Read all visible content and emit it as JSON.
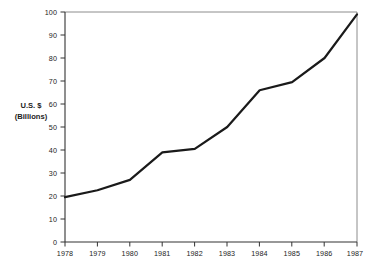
{
  "chart_data": {
    "type": "line",
    "title": "",
    "subtitle": "",
    "xlabel": "",
    "ylabel": "U.S. $\n(Billions)",
    "ylabel_line1": "U.S. $",
    "ylabel_line2": "(Billions)",
    "categories": [
      "1978",
      "1979",
      "1980",
      "1981",
      "1982",
      "1983",
      "1984",
      "1985",
      "1986",
      "1987"
    ],
    "x": [
      1978,
      1979,
      1980,
      1981,
      1982,
      1983,
      1984,
      1985,
      1986,
      1987
    ],
    "values": [
      19.5,
      22.5,
      27,
      39,
      40.5,
      50,
      66,
      69.5,
      80,
      99
    ],
    "series": [
      {
        "name": "U.S. $ (Billions)",
        "values": [
          19.5,
          22.5,
          27,
          39,
          40.5,
          50,
          66,
          69.5,
          80,
          99
        ]
      }
    ],
    "xlim": [
      1978,
      1987
    ],
    "ylim": [
      0,
      100
    ],
    "yticks": [
      0,
      10,
      20,
      30,
      40,
      50,
      60,
      70,
      80,
      90,
      100
    ],
    "ytick_labels": [
      "0",
      "10",
      "20",
      "30",
      "40",
      "50",
      "60",
      "70",
      "80",
      "90",
      "100"
    ],
    "xticks": [
      1978,
      1979,
      1980,
      1981,
      1982,
      1983,
      1984,
      1985,
      1986,
      1987
    ],
    "xtick_labels": [
      "1978",
      "1979",
      "1980",
      "1981",
      "1982",
      "1983",
      "1984",
      "1985",
      "1986",
      "1987"
    ],
    "grid": false,
    "legend": false,
    "legend_position": "none",
    "line_color": "#1a1a1a",
    "line_width": 2.2,
    "axis_color": "#3a3a3a",
    "frame_color": "#6a6a6a",
    "background_color": "#ffffff",
    "markers": false,
    "annotations": []
  },
  "axis": {
    "y_title_line1": "U.S. $",
    "y_title_line2": "(Billions)"
  }
}
